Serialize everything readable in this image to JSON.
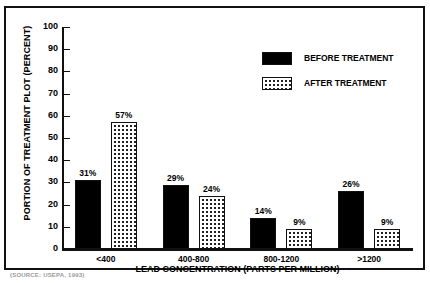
{
  "chart_data": {
    "type": "bar",
    "title": "",
    "xlabel": "LEAD CONCENTRATION (PARTS PER MILLION)",
    "ylabel": "PORTION OF TREATMENT PLOT (PERCENT)",
    "categories": [
      "<400",
      "400-800",
      "800-1200",
      ">1200"
    ],
    "series": [
      {
        "name": "BEFORE TREATMENT",
        "values": [
          31,
          29,
          14,
          26
        ],
        "fill": "solid-black",
        "color": "#000000"
      },
      {
        "name": "AFTER TREATMENT",
        "values": [
          57,
          24,
          9,
          9
        ],
        "fill": "dotted-stipple",
        "color": "#ffffff"
      }
    ],
    "value_labels": [
      [
        "31%",
        "29%",
        "14%",
        "26%"
      ],
      [
        "57%",
        "24%",
        "9%",
        "9%"
      ]
    ],
    "ylim": [
      0,
      100
    ],
    "yticks": [
      0,
      10,
      20,
      30,
      40,
      50,
      60,
      70,
      80,
      90,
      100
    ],
    "ytick_labels": [
      "0",
      "10",
      "20",
      "30",
      "40",
      "50",
      "60",
      "70",
      "80",
      "90",
      "100"
    ],
    "grid": false,
    "legend_position": "top-right"
  },
  "legend": {
    "items": [
      {
        "label": "BEFORE TREATMENT",
        "swatch": "solid-black-swatch"
      },
      {
        "label": "AFTER TREATMENT",
        "swatch": "dotted-swatch"
      }
    ]
  },
  "source": {
    "caption": "(SOURCE: USEPA, 1993)"
  }
}
